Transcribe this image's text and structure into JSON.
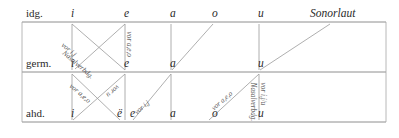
{
  "diagram": {
    "rows": [
      {
        "id": "idg",
        "label": "idg.",
        "label_x": 26,
        "label_y": 8,
        "rule_y": 22,
        "rule_x1": 22,
        "rule_x2": 386
      },
      {
        "id": "germ",
        "label": "germ.",
        "label_x": 26,
        "label_y": 58,
        "rule_y": 72,
        "rule_x1": 22,
        "rule_x2": 386
      },
      {
        "id": "ahd",
        "label": "ahd.",
        "label_x": 26,
        "label_y": 108,
        "rule_y": 122,
        "rule_x1": 22,
        "rule_x2": 386
      }
    ],
    "borders": [
      {
        "name": "left-border",
        "x": 22,
        "y1": 22,
        "y2": 122
      },
      {
        "name": "right-border",
        "x": 386,
        "y1": 22,
        "y2": 122
      }
    ],
    "vowels": {
      "idg": [
        {
          "text": "i",
          "x": 71,
          "y": 8
        },
        {
          "text": "e",
          "x": 124,
          "y": 8
        },
        {
          "text": "a",
          "x": 170,
          "y": 8
        },
        {
          "text": "o",
          "x": 212,
          "y": 8
        },
        {
          "text": "u",
          "x": 258,
          "y": 8
        }
      ],
      "germ": [
        {
          "text": "i",
          "x": 71,
          "y": 58
        },
        {
          "text": "e",
          "x": 124,
          "y": 58
        },
        {
          "text": "a",
          "x": 170,
          "y": 58
        },
        {
          "text": "u",
          "x": 258,
          "y": 58
        }
      ],
      "ahd": [
        {
          "text": "i",
          "x": 71,
          "y": 108
        },
        {
          "text": "ë",
          "x": 117,
          "y": 108
        },
        {
          "text": "e",
          "x": 130,
          "y": 108
        },
        {
          "text": "a",
          "x": 170,
          "y": 108
        },
        {
          "text": "o",
          "x": 212,
          "y": 108
        },
        {
          "text": "u",
          "x": 258,
          "y": 108
        }
      ]
    },
    "sonorlaut": {
      "text": "Sonorlaut",
      "x": 310,
      "y": 8
    },
    "connectors_upper": [
      {
        "name": "idg-i-to-germ-i",
        "x1": 72,
        "y1": 24,
        "x2": 72,
        "y2": 70
      },
      {
        "name": "idg-i-to-germ-e",
        "x1": 72,
        "y1": 24,
        "x2": 125,
        "y2": 70
      },
      {
        "name": "idg-e-to-germ-e",
        "x1": 125,
        "y1": 24,
        "x2": 125,
        "y2": 70
      },
      {
        "name": "idg-e-to-germ-i",
        "x1": 125,
        "y1": 24,
        "x2": 75,
        "y2": 69
      },
      {
        "name": "idg-a-to-germ-a",
        "x1": 171,
        "y1": 24,
        "x2": 171,
        "y2": 70
      },
      {
        "name": "idg-o-to-germ-a",
        "x1": 213,
        "y1": 24,
        "x2": 172,
        "y2": 70
      },
      {
        "name": "idg-u-to-germ-u",
        "x1": 259,
        "y1": 24,
        "x2": 259,
        "y2": 70
      },
      {
        "name": "sonorlaut-to-germ-u",
        "x1": 330,
        "y1": 24,
        "x2": 260,
        "y2": 70
      }
    ],
    "connectors_lower": [
      {
        "name": "germ-i-to-ahd-i",
        "x1": 72,
        "y1": 74,
        "x2": 72,
        "y2": 120
      },
      {
        "name": "germ-i-to-ahd-e-umlaut",
        "x1": 72,
        "y1": 74,
        "x2": 120,
        "y2": 120
      },
      {
        "name": "germ-e-to-ahd-i",
        "x1": 125,
        "y1": 74,
        "x2": 73,
        "y2": 120
      },
      {
        "name": "germ-e-to-ahd-e-umlaut",
        "x1": 125,
        "y1": 74,
        "x2": 125,
        "y2": 120
      },
      {
        "name": "germ-a-to-ahd-e",
        "x1": 171,
        "y1": 74,
        "x2": 133,
        "y2": 120
      },
      {
        "name": "germ-a-to-ahd-a",
        "x1": 171,
        "y1": 74,
        "x2": 171,
        "y2": 120
      },
      {
        "name": "germ-u-to-ahd-o",
        "x1": 259,
        "y1": 74,
        "x2": 209,
        "y2": 120
      },
      {
        "name": "germ-u-to-ahd-u",
        "x1": 259,
        "y1": 74,
        "x2": 259,
        "y2": 120
      }
    ],
    "annotations": [
      {
        "name": "ann-vor-i-j-upper",
        "text": "vor i,j",
        "x": 62,
        "y": 41,
        "rot": 41
      },
      {
        "name": "ann-nasalverbdg-upper",
        "text": "Nasalverbdg.",
        "x": 63,
        "y": 49,
        "rot": 41
      },
      {
        "name": "ann-vor-a-e-o-upper",
        "text": "vor a,e,o",
        "x": 128,
        "y": 28,
        "rot": 90
      },
      {
        "name": "ann-vor-a-e-o-lower-left",
        "text": "vor a,e,o",
        "x": 70,
        "y": 82,
        "rot": 41
      },
      {
        "name": "ann-vor-u-lower-left",
        "text": "vor u",
        "x": 118,
        "y": 82,
        "rot": 139
      },
      {
        "name": "ann-vor-i-j-lower",
        "text": "vor i,j",
        "x": 136,
        "y": 110,
        "rot": -41
      },
      {
        "name": "ann-vor-a-e-o-lower-right",
        "text": "vor a,e,o",
        "x": 213,
        "y": 106,
        "rot": -41
      },
      {
        "name": "ann-nasalverbdg-lower",
        "text": "Nasalverbdg.",
        "x": 252,
        "y": 79,
        "rot": 90
      },
      {
        "name": "ann-vor-i-j-u-lower",
        "text": "vor i,j/u",
        "x": 262,
        "y": 79,
        "rot": 90
      }
    ]
  }
}
